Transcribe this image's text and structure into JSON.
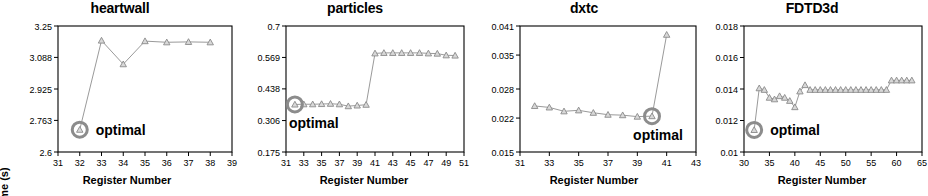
{
  "figure": {
    "axis_label_x": "Register Number",
    "axis_label_y": "Kernel Time (s)",
    "optimal_label": "optimal",
    "marker_color": "#8a8a8a",
    "line_color": "#9a9a9a",
    "highlight_color": "#8c8c8c",
    "axis_color": "#000000",
    "text_color": "#000000"
  },
  "chart_data": [
    {
      "type": "line",
      "title": "heartwall",
      "xlabel": "Register Number",
      "ylabel": "Kernel Time (s)",
      "xlim": [
        31,
        39
      ],
      "ylim": [
        2.6,
        3.25
      ],
      "xticks": [
        31,
        32,
        33,
        34,
        35,
        36,
        37,
        38,
        39
      ],
      "yticks": [
        2.6,
        2.763,
        2.925,
        3.088,
        3.25
      ],
      "ytick_labels": [
        "2.6",
        "2.763",
        "2.925",
        "3.088",
        "3.25"
      ],
      "grid": false,
      "legend": "none",
      "x": [
        32,
        33,
        34,
        35,
        36,
        37,
        38
      ],
      "values": [
        2.715,
        3.175,
        3.053,
        3.172,
        3.166,
        3.168,
        3.166
      ],
      "optimal": {
        "x": 32,
        "y": 2.715,
        "label": "optimal"
      }
    },
    {
      "type": "line",
      "title": "particles",
      "xlabel": "Register Number",
      "ylabel": "Kernel Time (s)",
      "xlim": [
        31,
        51
      ],
      "ylim": [
        0.175,
        0.7
      ],
      "xticks": [
        31,
        33,
        35,
        37,
        39,
        41,
        43,
        45,
        47,
        49,
        51
      ],
      "yticks": [
        0.175,
        0.306,
        0.438,
        0.569,
        0.7
      ],
      "ytick_labels": [
        "0.175",
        "0.306",
        "0.438",
        "0.569",
        "0.7"
      ],
      "grid": false,
      "legend": "none",
      "x": [
        32,
        33,
        34,
        35,
        36,
        37,
        38,
        39,
        40,
        41,
        42,
        43,
        44,
        45,
        46,
        47,
        48,
        49,
        50
      ],
      "values": [
        0.373,
        0.374,
        0.374,
        0.375,
        0.376,
        0.374,
        0.366,
        0.369,
        0.372,
        0.586,
        0.588,
        0.588,
        0.588,
        0.588,
        0.588,
        0.586,
        0.585,
        0.578,
        0.577
      ],
      "optimal": {
        "x": 32,
        "y": 0.373,
        "label": "optimal"
      }
    },
    {
      "type": "line",
      "title": "dxtc",
      "xlabel": "Register Number",
      "ylabel": "Kernel Time (s)",
      "xlim": [
        31,
        43
      ],
      "ylim": [
        0.015,
        0.041
      ],
      "xticks": [
        31,
        33,
        35,
        37,
        39,
        41,
        43
      ],
      "yticks": [
        0.015,
        0.022,
        0.028,
        0.035,
        0.041
      ],
      "ytick_labels": [
        "0.015",
        "0.022",
        "0.028",
        "0.035",
        "0.041"
      ],
      "grid": false,
      "legend": "none",
      "x": [
        32,
        33,
        34,
        35,
        36,
        37,
        38,
        39,
        40,
        41
      ],
      "values": [
        0.0245,
        0.0242,
        0.0234,
        0.0236,
        0.0231,
        0.0227,
        0.0226,
        0.0223,
        0.0224,
        0.0392
      ],
      "optimal": {
        "x": 40,
        "y": 0.0224,
        "label": "optimal"
      }
    },
    {
      "type": "line",
      "title": "FDTD3d",
      "xlabel": "Register Number",
      "ylabel": "Kernel Time (s)",
      "xlim": [
        30,
        65
      ],
      "ylim": [
        0.01,
        0.018
      ],
      "xticks": [
        30,
        35,
        40,
        45,
        50,
        55,
        60,
        65
      ],
      "yticks": [
        0.01,
        0.012,
        0.014,
        0.016,
        0.018
      ],
      "ytick_labels": [
        "0.01",
        "0.012",
        "0.014",
        "0.016",
        "0.018"
      ],
      "grid": false,
      "legend": "none",
      "x": [
        32,
        33,
        34,
        35,
        36,
        37,
        38,
        39,
        40,
        41,
        42,
        43,
        44,
        45,
        46,
        47,
        48,
        49,
        50,
        51,
        52,
        53,
        54,
        55,
        56,
        57,
        58,
        59,
        60,
        61,
        62,
        63
      ],
      "values": [
        0.0114,
        0.01405,
        0.01395,
        0.01345,
        0.01335,
        0.01355,
        0.01345,
        0.01325,
        0.01285,
        0.01385,
        0.01425,
        0.01395,
        0.01395,
        0.01395,
        0.01395,
        0.01395,
        0.01395,
        0.01395,
        0.01395,
        0.01395,
        0.01395,
        0.01395,
        0.01395,
        0.01395,
        0.01395,
        0.01395,
        0.01395,
        0.01455,
        0.01455,
        0.01455,
        0.01455,
        0.01455
      ],
      "optimal": {
        "x": 32,
        "y": 0.0114,
        "label": "optimal"
      }
    }
  ]
}
